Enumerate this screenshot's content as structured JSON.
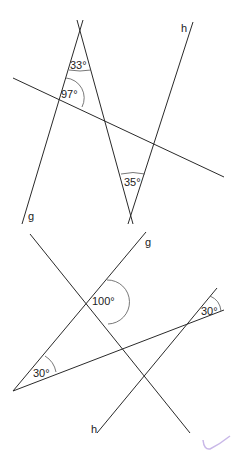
{
  "figures": [
    {
      "name": "top-figure",
      "line_labels": {
        "g": "g",
        "h": "h"
      },
      "angles": {
        "a1": "33°",
        "a2": "97°",
        "a3": "35°"
      }
    },
    {
      "name": "bottom-figure",
      "line_labels": {
        "g": "g",
        "h": "h"
      },
      "angles": {
        "a1": "100°",
        "a2": "30°",
        "a3": "30°"
      }
    }
  ]
}
